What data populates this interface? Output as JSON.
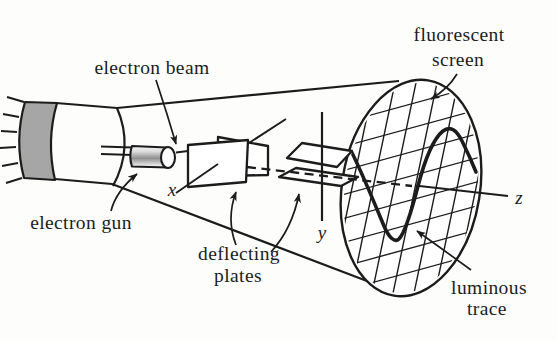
{
  "labels": {
    "electron_beam": "electron beam",
    "fluorescent_screen": [
      "fluorescent",
      "screen"
    ],
    "electron_gun": "electron gun",
    "deflecting_plates": [
      "deflecting",
      "plates"
    ],
    "luminous_trace": [
      "luminous",
      "trace"
    ],
    "axis_x": "x",
    "axis_y": "y",
    "axis_z": "z"
  },
  "colors": {
    "ink": "#1c1c1c",
    "background": "#fdfdfc",
    "base_band_gray": "#a6a6a6",
    "gun_shade_gray": "#909090"
  }
}
